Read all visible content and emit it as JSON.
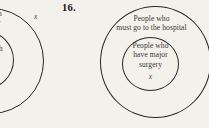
{
  "page": {
    "background_color": "#f3f1ec",
    "ink_color": "#2a2825"
  },
  "problem": {
    "number_label": "16."
  },
  "left_figure": {
    "description": "clipped nested-circle venn diagram at page edge",
    "fragment_line_1": "h",
    "fragment_line_2": "r",
    "fragment_line_3": "h",
    "fragment_line_4": "l",
    "variable_label": "x"
  },
  "main_figure": {
    "outer_circle": {
      "label_line_1": "People who",
      "label_line_2": "must go to the hospital"
    },
    "inner_circle": {
      "label_line_1": "People who",
      "label_line_2": "have major",
      "label_line_3": "surgery",
      "variable_label": "x"
    }
  }
}
